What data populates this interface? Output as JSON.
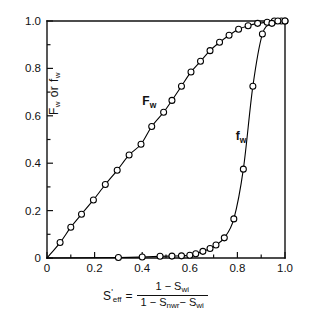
{
  "chart_data": {
    "type": "line",
    "title": "",
    "xlabel": "S'eff = (1 - Swi) / (1 - Snwr - Swi)",
    "ylabel": "Fw or fw",
    "xlim": [
      0,
      1.0
    ],
    "ylim": [
      0,
      1.0
    ],
    "grid": false,
    "legend_position": "inline-annotations",
    "x_ticks": [
      "0",
      "0.2",
      "0.4",
      "0.6",
      "0.8",
      "1.0"
    ],
    "x_tick_values": [
      0,
      0.2,
      0.4,
      0.6,
      0.8,
      1.0
    ],
    "x_minor_tick_values": [
      0.1,
      0.3,
      0.5,
      0.7,
      0.9
    ],
    "y_ticks": [
      "0",
      "0.2",
      "0.4",
      "0.6",
      "0.8",
      "1.0"
    ],
    "y_tick_values": [
      0,
      0.2,
      0.4,
      0.6,
      0.8,
      1.0
    ],
    "y_minor_tick_values": [
      0.1,
      0.3,
      0.5,
      0.7,
      0.9
    ],
    "marker": "open-circle",
    "line_color": "#000000",
    "series": [
      {
        "name": "Fw",
        "label": "F_w",
        "label_x": 0.43,
        "label_y": 0.645,
        "x": [
          0.0,
          0.055,
          0.1,
          0.145,
          0.195,
          0.245,
          0.295,
          0.345,
          0.395,
          0.44,
          0.49,
          0.525,
          0.565,
          0.605,
          0.645,
          0.685,
          0.725,
          0.765,
          0.805,
          0.845,
          0.885,
          0.925,
          0.955,
          0.985,
          1.0
        ],
        "y": [
          0.0,
          0.065,
          0.13,
          0.185,
          0.245,
          0.31,
          0.37,
          0.435,
          0.48,
          0.555,
          0.615,
          0.665,
          0.725,
          0.785,
          0.83,
          0.875,
          0.91,
          0.94,
          0.965,
          0.98,
          0.99,
          0.995,
          1.0,
          1.0,
          1.0
        ]
      },
      {
        "name": "fw",
        "label": "f_w",
        "label_x": 0.815,
        "label_y": 0.5,
        "x": [
          0.0,
          0.3,
          0.4,
          0.475,
          0.525,
          0.565,
          0.6,
          0.625,
          0.655,
          0.685,
          0.71,
          0.745,
          0.785,
          0.825,
          0.865,
          0.905,
          0.945,
          0.97,
          1.0
        ],
        "y": [
          0.0,
          0.002,
          0.004,
          0.007,
          0.008,
          0.009,
          0.012,
          0.018,
          0.028,
          0.04,
          0.055,
          0.085,
          0.165,
          0.375,
          0.725,
          0.945,
          0.99,
          1.0,
          1.0
        ]
      }
    ]
  },
  "axis_labels": {
    "y_text_main": "F",
    "y_text_sub1": "w",
    "y_text_or": "or",
    "y_text_main2": "f",
    "y_text_sub2": "w",
    "x_symbol": "S",
    "x_symbol_prime": "'",
    "x_symbol_sub": "eff",
    "x_equals": "=",
    "x_numerator_1": "1 − S",
    "x_numerator_sub": "wi",
    "x_denominator_1": "1 − S",
    "x_denominator_sub1": "nwr",
    "x_denominator_2": "− S",
    "x_denominator_sub2": "wi"
  },
  "annotations": {
    "fw_upper": "F",
    "fw_upper_sub": "w",
    "fw_lower": "f",
    "fw_lower_sub": "w"
  }
}
